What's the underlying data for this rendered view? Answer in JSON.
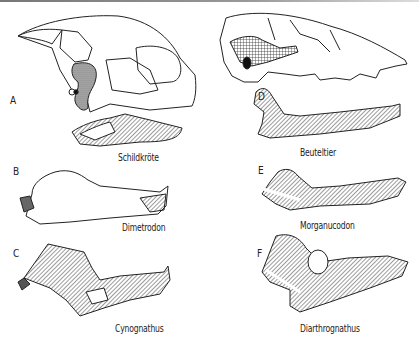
{
  "figure": {
    "panels": [
      {
        "letter": "A",
        "caption": "Schildkröte"
      },
      {
        "letter": "B",
        "caption": "Dimetrodon"
      },
      {
        "letter": "C",
        "caption": "Cynognathus"
      },
      {
        "letter": "D",
        "caption": "Beuteltier"
      },
      {
        "letter": "E",
        "caption": "Morganucodon"
      },
      {
        "letter": "F",
        "caption": "Diarthrognathus"
      }
    ]
  },
  "colors": {
    "ink": "#222222",
    "background": "#ffffff"
  }
}
